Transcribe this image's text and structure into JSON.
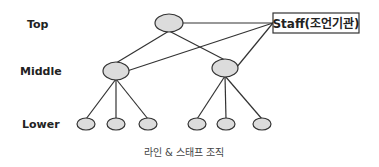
{
  "diagram": {
    "levels": {
      "top": "Top",
      "middle": "Middle",
      "lower": "Lower"
    },
    "staff_label": "Staff(조언기관)",
    "caption": "라인 & 스태프 조직",
    "colors": {
      "node_fill": "#dcdcdc",
      "stroke": "#333333"
    },
    "nodes": [
      {
        "id": "top",
        "level": "top"
      },
      {
        "id": "mid-left",
        "level": "middle",
        "parent": "top"
      },
      {
        "id": "mid-right",
        "level": "middle",
        "parent": "top"
      },
      {
        "id": "low-1",
        "level": "lower",
        "parent": "mid-left"
      },
      {
        "id": "low-2",
        "level": "lower",
        "parent": "mid-left"
      },
      {
        "id": "low-3",
        "level": "lower",
        "parent": "mid-left"
      },
      {
        "id": "low-4",
        "level": "lower",
        "parent": "mid-right"
      },
      {
        "id": "low-5",
        "level": "lower",
        "parent": "mid-right"
      },
      {
        "id": "low-6",
        "level": "lower",
        "parent": "mid-right"
      }
    ],
    "staff_links": [
      "top",
      "mid-left",
      "mid-right"
    ]
  }
}
